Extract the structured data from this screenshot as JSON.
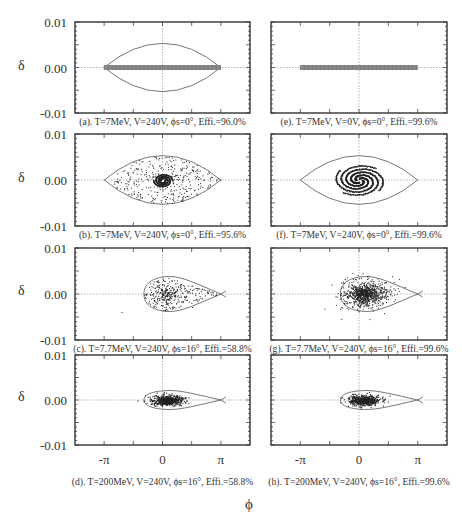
{
  "figure": {
    "xlabel": "ϕ",
    "ylabel": "δ",
    "y_ticks": [
      "0.01",
      "0.00",
      "-0.01"
    ],
    "x_ticks": [
      "-π",
      "0",
      "π"
    ]
  },
  "panels": [
    {
      "id": "a",
      "caption": "(a). T=7MeV, V=240V, ϕs=0°, Effi.=96.0%",
      "T": "7MeV",
      "V": "240V",
      "phi_s": "0°",
      "efficiency": "96.0%",
      "distribution": "line",
      "separatrix": "symmetric"
    },
    {
      "id": "b",
      "caption": "(b). T=7MeV, V=240V, ϕs=0°, Effi.=95.6%",
      "T": "7MeV",
      "V": "240V",
      "phi_s": "0°",
      "efficiency": "95.6%",
      "distribution": "filled-bucket-spiral",
      "separatrix": "symmetric"
    },
    {
      "id": "c",
      "caption": "(c). T=7.7MeV, V=240V, ϕs=16°, Effi.=58.8%",
      "T": "7.7MeV",
      "V": "240V",
      "phi_s": "16°",
      "efficiency": "58.8%",
      "distribution": "filled-fish",
      "separatrix": "fish"
    },
    {
      "id": "d",
      "caption": "(d). T=200MeV, V=240V, ϕs=16°, Effi.=58.8%",
      "T": "200MeV",
      "V": "240V",
      "phi_s": "16°",
      "efficiency": "58.8%",
      "distribution": "core",
      "separatrix": "fish-narrow"
    },
    {
      "id": "e",
      "caption": "(e). T=7MeV, V=0V, ϕs=0°, Effi.=99.6%",
      "T": "7MeV",
      "V": "0V",
      "phi_s": "0°",
      "efficiency": "99.6%",
      "distribution": "line",
      "separatrix": "none"
    },
    {
      "id": "f",
      "caption": "(f). T=7MeV, V=240V, ϕs=0°, Effi.=99.6%",
      "T": "7MeV",
      "V": "240V",
      "phi_s": "0°",
      "efficiency": "99.6%",
      "distribution": "spiral",
      "separatrix": "symmetric"
    },
    {
      "id": "g",
      "caption": "(g). T=7.7MeV, V=240V, ϕs=16°, Effi.=99.6%",
      "T": "7.7MeV",
      "V": "240V",
      "phi_s": "16°",
      "efficiency": "99.6%",
      "distribution": "core-wide",
      "separatrix": "fish"
    },
    {
      "id": "h",
      "caption": "(h). T=200MeV, V=240V, ϕs=16°, Effi.=99.6%",
      "T": "200MeV",
      "V": "240V",
      "phi_s": "16°",
      "efficiency": "99.6%",
      "distribution": "core",
      "separatrix": "fish-narrow"
    }
  ],
  "chart_data": {
    "type": "scatter",
    "xlabel": "ϕ",
    "ylabel": "δ",
    "xlim": [
      -4.71,
      4.71
    ],
    "ylim": [
      -0.01,
      0.01
    ],
    "x_tick_labels": [
      "-π",
      "0",
      "π"
    ],
    "y_tick_labels": [
      "0.01",
      "0.00",
      "-0.01"
    ],
    "grid": "dotted lines at ϕ=0 and δ=0",
    "layout": "4 rows × 2 columns",
    "panels": [
      {
        "label": "(a)",
        "T_MeV": 7,
        "V_V": 240,
        "phi_s_deg": 0,
        "efficiency_pct": 96.0,
        "separatrix_halfheight_delta": 0.0053,
        "particles": "uniform line ϕ∈[-π,π], δ=0"
      },
      {
        "label": "(b)",
        "T_MeV": 7,
        "V_V": 240,
        "phi_s_deg": 0,
        "efficiency_pct": 95.6,
        "separatrix_halfheight_delta": 0.0053,
        "particles": "filled bucket with central S-spiral"
      },
      {
        "label": "(c)",
        "T_MeV": 7.7,
        "V_V": 240,
        "phi_s_deg": 16,
        "efficiency_pct": 58.8,
        "separatrix_halfheight_delta": 0.0038,
        "separatrix_phi_range": [
          -1.0,
          3.6
        ],
        "particles": "filled fish-shaped bucket"
      },
      {
        "label": "(d)",
        "T_MeV": 200,
        "V_V": 240,
        "phi_s_deg": 16,
        "efficiency_pct": 58.8,
        "separatrix_halfheight_delta": 0.0021,
        "separatrix_phi_range": [
          -1.0,
          3.6
        ],
        "particles": "dense core ϕ≈[-0.4,0.9], |δ|<0.001"
      },
      {
        "label": "(e)",
        "T_MeV": 7,
        "V_V": 0,
        "phi_s_deg": 0,
        "efficiency_pct": 99.6,
        "separatrix_halfheight_delta": 0,
        "particles": "uniform line ϕ∈[-π,π], δ=0"
      },
      {
        "label": "(f)",
        "T_MeV": 7,
        "V_V": 240,
        "phi_s_deg": 0,
        "efficiency_pct": 99.6,
        "separatrix_halfheight_delta": 0.0053,
        "particles": "spiral core ϕ≈[-1.2,1.2], |δ|<0.0028"
      },
      {
        "label": "(g)",
        "T_MeV": 7.7,
        "V_V": 240,
        "phi_s_deg": 16,
        "efficiency_pct": 99.6,
        "separatrix_halfheight_delta": 0.0038,
        "separatrix_phi_range": [
          -1.0,
          3.6
        ],
        "particles": "core ϕ≈[-0.7,1.2], |δ|<0.0028"
      },
      {
        "label": "(h)",
        "T_MeV": 200,
        "V_V": 240,
        "phi_s_deg": 16,
        "efficiency_pct": 99.6,
        "separatrix_halfheight_delta": 0.0021,
        "separatrix_phi_range": [
          -1.0,
          3.6
        ],
        "particles": "dense core ϕ≈[-0.4,0.7], |δ|<0.0009"
      }
    ]
  }
}
